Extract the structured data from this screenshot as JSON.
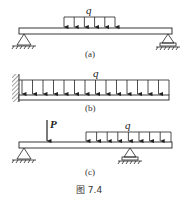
{
  "figure": {
    "caption": "图 7.4",
    "background": "#ffffff",
    "stroke_color": "#222222",
    "panels": [
      {
        "id": "a",
        "label": "(a)",
        "description": "Simply supported beam, pin at left, roller at right, partial uniformly distributed load in middle",
        "load_label": "q",
        "supports": [
          "pin-left",
          "roller-right"
        ]
      },
      {
        "id": "b",
        "label": "(b)",
        "description": "Cantilever beam fixed at left wall with full-length uniformly distributed load",
        "load_label": "q",
        "supports": [
          "fixed-left"
        ]
      },
      {
        "id": "c",
        "label": "(c)",
        "description": "Overhanging beam, pin at left, roller near right, point load P and distributed load q",
        "point_load_label": "P",
        "load_label": "q",
        "supports": [
          "pin-left",
          "roller-middle-right"
        ]
      }
    ]
  }
}
